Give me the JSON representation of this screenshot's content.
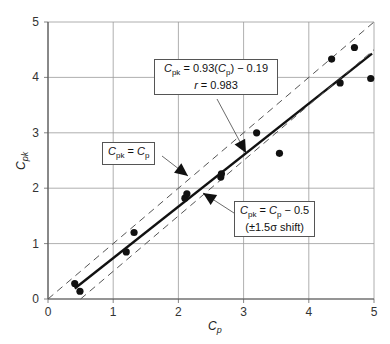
{
  "chart_data": {
    "type": "scatter",
    "title": "",
    "xlabel": "Cp",
    "ylabel": "Cpk",
    "xlim": [
      0,
      5
    ],
    "ylim": [
      0,
      5
    ],
    "xticks": [
      "0",
      "1",
      "2",
      "3",
      "4",
      "5"
    ],
    "yticks": [
      "0",
      "1",
      "2",
      "3",
      "4",
      "5"
    ],
    "grid": true,
    "legend": null,
    "points": {
      "x": [
        0.41,
        0.49,
        1.2,
        1.32,
        2.1,
        2.13,
        2.65,
        2.66,
        3.2,
        3.55,
        4.35,
        4.48,
        4.7,
        4.95
      ],
      "y": [
        0.28,
        0.14,
        0.85,
        1.2,
        1.82,
        1.9,
        2.2,
        2.26,
        3.0,
        2.63,
        4.33,
        3.9,
        4.54,
        3.98
      ]
    },
    "series": [
      {
        "name": "Regression fit",
        "style": "solid",
        "x": [
          0.41,
          4.97
        ],
        "y": [
          0.19,
          4.43
        ]
      },
      {
        "name": "Cpk = Cp",
        "style": "dashed",
        "x": [
          0,
          5
        ],
        "y": [
          0,
          5
        ]
      },
      {
        "name": "Cpk = Cp - 0.5",
        "style": "dashed",
        "x": [
          0.5,
          5
        ],
        "y": [
          0,
          4.5
        ]
      }
    ],
    "annotations": [
      {
        "text": "Cpk = 0.93(Cp) - 0.19, r = 0.983",
        "target": "Regression fit"
      },
      {
        "text": "Cpk = Cp",
        "target": "Cpk = Cp"
      },
      {
        "text": "Cpk = Cp - 0.5 (±1.5σ shift)",
        "target": "Cpk = Cp - 0.5"
      }
    ]
  },
  "labels": {
    "xlabel_main": "C",
    "xlabel_sub": "p",
    "ylabel_main": "C",
    "ylabel_sub": "pk",
    "fit_eq_1": "= 0.93(",
    "fit_eq_2": ") − 0.19",
    "fit_r": "r",
    "fit_r_val": " = 0.983",
    "ident_eq": " = ",
    "shift_eq": " − 0.5",
    "shift_note": "(±1.5σ shift)",
    "c": "C",
    "pk": "pk",
    "p": "p"
  }
}
